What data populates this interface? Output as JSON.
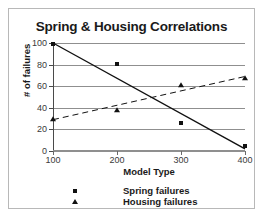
{
  "chart_data": {
    "type": "scatter",
    "title": "Spring & Housing Correlations",
    "xlabel": "Model Type",
    "ylabel": "# of failures",
    "x": [
      100,
      200,
      300,
      400
    ],
    "xticklabels": [
      "100",
      "200",
      "300",
      "400"
    ],
    "yticklabels": [
      "0",
      "20",
      "40",
      "60",
      "80",
      "100"
    ],
    "yticks": [
      0,
      20,
      40,
      60,
      80,
      100
    ],
    "xlim": [
      100,
      400
    ],
    "ylim": [
      0,
      100
    ],
    "grid": true,
    "grid_axis": "y",
    "legend_position": "bottom",
    "series": [
      {
        "name": "Spring failures",
        "marker": "square",
        "line_style": "solid",
        "color": "#111111",
        "values": [
          99,
          81,
          26,
          5
        ],
        "trend": {
          "x0": 100,
          "y0": 100,
          "x1": 400,
          "y1": 2
        }
      },
      {
        "name": "Housing failures",
        "marker": "triangle",
        "line_style": "dashed",
        "color": "#111111",
        "values": [
          30,
          38,
          61,
          68
        ],
        "trend": {
          "x0": 100,
          "y0": 29,
          "x1": 400,
          "y1": 69
        }
      }
    ]
  }
}
